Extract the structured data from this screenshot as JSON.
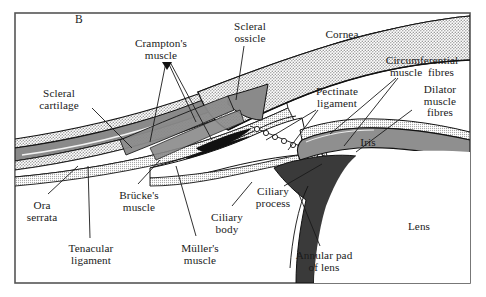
{
  "figure": {
    "panel_label": "B",
    "caption_type": "anatomical-cross-section",
    "frame_color": "#555555",
    "background_color": "#ffffff"
  },
  "palette": {
    "stipple_light": "#d8d8d8",
    "cartilage_gray": "#8a8a8a",
    "iris_gray": "#8f8f8f",
    "annular_pad_dark": "#3a3a3a",
    "outline_black": "#111111",
    "text_color": "#1a1a1a"
  },
  "labels": [
    {
      "id": "panel-b",
      "text": "B",
      "x": 72,
      "y": 14,
      "w": 14,
      "lines": 1
    },
    {
      "id": "crampton",
      "text": "Crampton's\nmuscle",
      "x": 122,
      "y": 38,
      "w": 78,
      "lines": 2
    },
    {
      "id": "scleral-ossicle",
      "text": "Scleral\nossicle",
      "x": 222,
      "y": 21,
      "w": 56,
      "lines": 2
    },
    {
      "id": "cornea",
      "text": "Cornea",
      "x": 318,
      "y": 29,
      "w": 48,
      "lines": 1
    },
    {
      "id": "circumferential",
      "text": "Circumferential\nmuscle  fibres",
      "x": 372,
      "y": 55,
      "w": 100,
      "lines": 2
    },
    {
      "id": "pectinate",
      "text": "Pectinate\nligament",
      "x": 306,
      "y": 86,
      "w": 62,
      "lines": 2
    },
    {
      "id": "dilator",
      "text": "Dilator\nmuscle\nfibres",
      "x": 414,
      "y": 84,
      "w": 52,
      "lines": 3
    },
    {
      "id": "iris",
      "text": "Iris",
      "x": 355,
      "y": 137,
      "w": 26,
      "lines": 1
    },
    {
      "id": "scleral-cartilage",
      "text": "Scleral\ncartilage",
      "x": 28,
      "y": 88,
      "w": 62,
      "lines": 2
    },
    {
      "id": "ora-serrata",
      "text": "Ora\nserrata",
      "x": 18,
      "y": 200,
      "w": 48,
      "lines": 2
    },
    {
      "id": "tenacular",
      "text": "Tenacular\nligament",
      "x": 58,
      "y": 243,
      "w": 66,
      "lines": 2
    },
    {
      "id": "brucke",
      "text": "Brücke's\nmuscle",
      "x": 110,
      "y": 190,
      "w": 58,
      "lines": 2
    },
    {
      "id": "muller",
      "text": "Müller's\nmuscle",
      "x": 172,
      "y": 243,
      "w": 56,
      "lines": 2
    },
    {
      "id": "ciliary-body",
      "text": "Ciliary\nbody",
      "x": 204,
      "y": 212,
      "w": 46,
      "lines": 2
    },
    {
      "id": "ciliary-process",
      "text": "Ciliary\nprocess",
      "x": 248,
      "y": 186,
      "w": 50,
      "lines": 2
    },
    {
      "id": "annular-pad",
      "text": "Annular pad\nof lens",
      "x": 286,
      "y": 250,
      "w": 76,
      "lines": 2
    },
    {
      "id": "lens",
      "text": "Lens",
      "x": 402,
      "y": 221,
      "w": 34,
      "lines": 1
    }
  ],
  "structures": [
    {
      "id": "sclera-outer-stipple",
      "name": "sclera-outer-layer",
      "fill": "stipple"
    },
    {
      "id": "scleral-cartilage",
      "name": "scleral-cartilage",
      "fill": "gray"
    },
    {
      "id": "sclera-inner-stipple",
      "name": "sclera-inner-layer",
      "fill": "stipple"
    },
    {
      "id": "retina-band",
      "name": "retina-band",
      "fill": "white"
    },
    {
      "id": "choroid-band",
      "name": "choroid-band",
      "fill": "stipple"
    },
    {
      "id": "cornea",
      "name": "cornea",
      "fill": "stipple"
    },
    {
      "id": "scleral-ossicle",
      "name": "scleral-ossicle",
      "fill": "gray"
    },
    {
      "id": "cramptons-muscle",
      "name": "cramptons-muscle",
      "fill": "gray"
    },
    {
      "id": "brucke-muller",
      "name": "ciliary-muscles",
      "fill": "black"
    },
    {
      "id": "pectinate-ligament",
      "name": "pectinate-ligament",
      "fill": "loops"
    },
    {
      "id": "iris",
      "name": "iris",
      "fill": "gray"
    },
    {
      "id": "iris-stipple-top",
      "name": "iris-stroma",
      "fill": "stipple"
    },
    {
      "id": "annular-pad",
      "name": "annular-pad-of-lens",
      "fill": "dark"
    },
    {
      "id": "lens",
      "name": "lens",
      "fill": "white"
    }
  ]
}
